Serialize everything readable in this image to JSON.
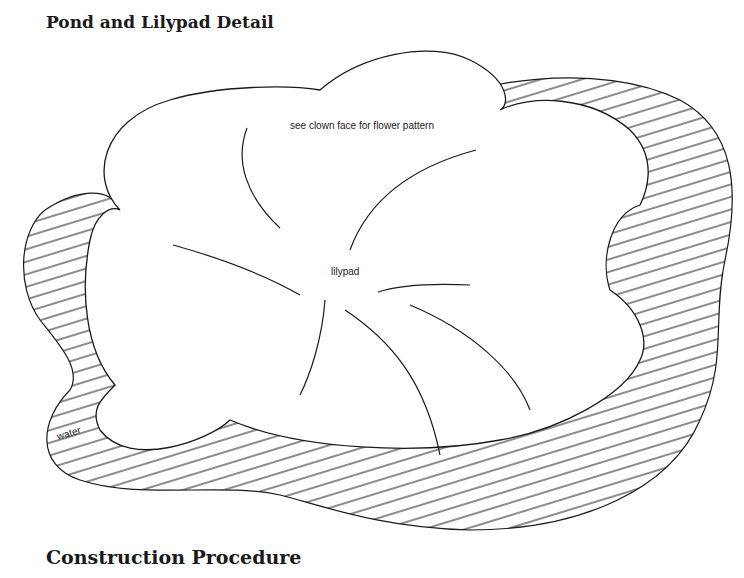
{
  "diagram": {
    "title": "Pond and Lilypad Detail",
    "labels": {
      "note": "see clown face for flower pattern",
      "lilypad": "lilypad",
      "water": "water"
    },
    "section_heading": "Construction Procedure",
    "colors": {
      "ink": "#1a1a1a",
      "background": "#ffffff"
    }
  }
}
